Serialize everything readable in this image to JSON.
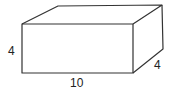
{
  "figure": {
    "type": "rectangular-prism",
    "labels": {
      "height": "4",
      "length": "10",
      "depth": "4"
    },
    "stroke_color": "#333333"
  }
}
